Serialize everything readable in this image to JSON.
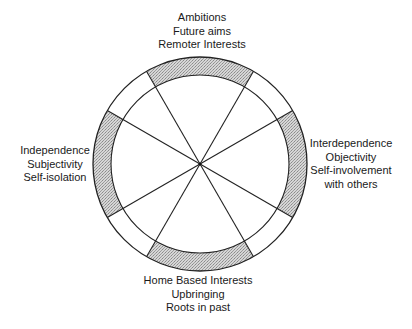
{
  "diagram": {
    "center": {
      "x": 200,
      "y": 164
    },
    "outer_radius": 107,
    "inner_radius": 89,
    "spoke_angles_deg": [
      -60,
      -30,
      30,
      60,
      120,
      150,
      210,
      240
    ],
    "shaded_segments": [
      {
        "name": "top",
        "from_deg": 240,
        "to_deg": 300
      },
      {
        "name": "right",
        "from_deg": -30,
        "to_deg": 30
      },
      {
        "name": "bottom",
        "from_deg": 60,
        "to_deg": 120
      },
      {
        "name": "left",
        "from_deg": 150,
        "to_deg": 210
      }
    ],
    "colors": {
      "stroke": "#222222",
      "shade": "#c8c8c8",
      "background": "#ffffff"
    }
  },
  "labels": {
    "top": {
      "lines": [
        "Ambitions",
        "Future aims",
        "Remoter Interests"
      ]
    },
    "right": {
      "lines": [
        "Interdependence",
        "Objectivity",
        "Self-involvement",
        "with others"
      ]
    },
    "left": {
      "lines": [
        "Independence",
        "Subjectivity",
        "Self-isolation"
      ]
    },
    "bottom": {
      "lines": [
        "Home Based Interests",
        "Upbringing",
        "Roots in past"
      ]
    }
  }
}
